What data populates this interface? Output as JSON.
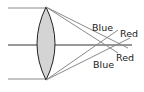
{
  "diagram": {
    "labels": {
      "blue_top": "Blue",
      "red_top": "Red",
      "blue_bottom": "Blue",
      "red_bottom": "Red"
    },
    "colors": {
      "lens_fill": "#d4d4d4",
      "lens_stroke": "#222222",
      "axis": "#333333",
      "rays": "#8a8a8a"
    }
  }
}
